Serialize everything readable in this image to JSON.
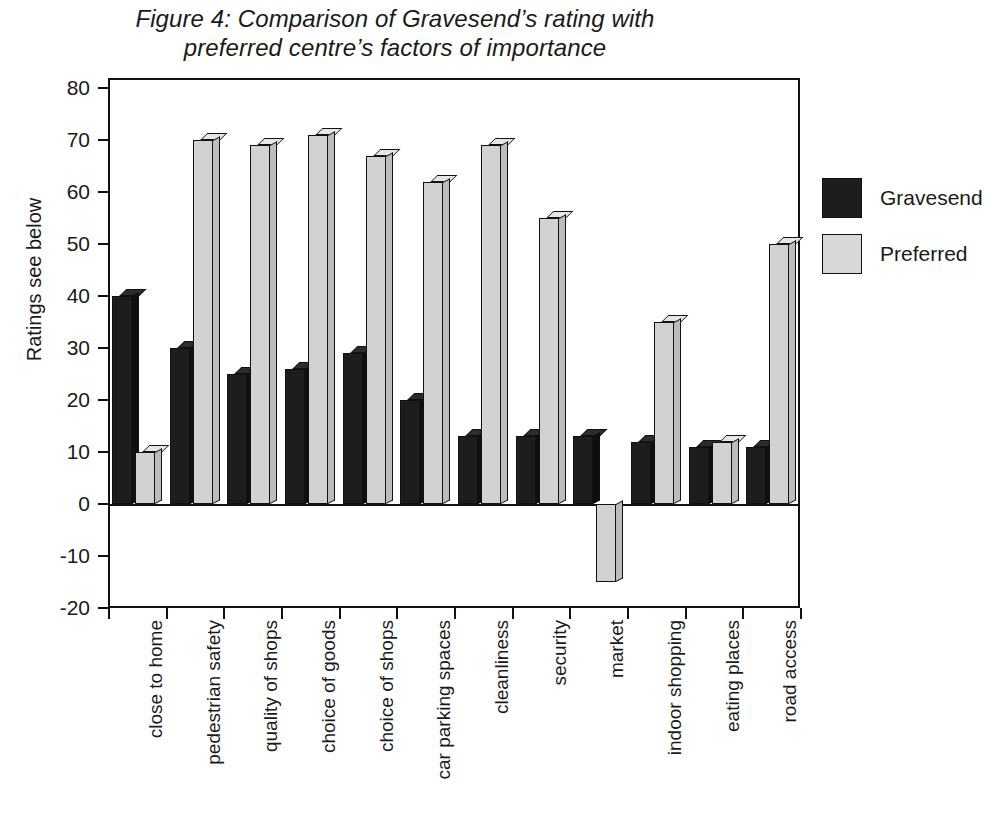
{
  "figure": {
    "title_line1": "Figure 4: Comparison of Gravesend’s rating with",
    "title_line2": "preferred centre’s factors of importance"
  },
  "axes": {
    "ylabel": "Ratings see below",
    "yticks": [
      80,
      70,
      60,
      50,
      40,
      30,
      20,
      10,
      0,
      -10,
      -20
    ],
    "ytick_labels": [
      "80",
      "70",
      "60",
      "50",
      "40",
      "30",
      "20",
      "10",
      "0",
      "-10",
      "-20"
    ]
  },
  "legend": {
    "position": "right",
    "entries": [
      {
        "label": "Gravesend",
        "color": "#1d1d1d"
      },
      {
        "label": "Preferred",
        "color": "#d8d8d8"
      }
    ]
  },
  "chart_data": {
    "type": "bar",
    "title": "Figure 4: Comparison of Gravesend’s rating with preferred centre’s factors of importance",
    "xlabel": "",
    "ylabel": "Ratings see below",
    "ylim": [
      -20,
      80
    ],
    "ytick_step": 10,
    "grid": false,
    "legend_position": "right",
    "categories": [
      "close to home",
      "pedestrian safety",
      "quality of shops",
      "choice of goods",
      "choice of shops",
      "car parking spaces",
      "cleanliness",
      "security",
      "market",
      "indoor shopping",
      "eating places",
      "road access"
    ],
    "series": [
      {
        "name": "Gravesend",
        "color": "#1d1d1d",
        "values": [
          40,
          30,
          25,
          26,
          29,
          20,
          13,
          13,
          13,
          12,
          11,
          11
        ]
      },
      {
        "name": "Preferred",
        "color": "#d8d8d8",
        "values": [
          10,
          70,
          69,
          71,
          67,
          62,
          69,
          55,
          -15,
          35,
          12,
          50
        ]
      }
    ]
  }
}
